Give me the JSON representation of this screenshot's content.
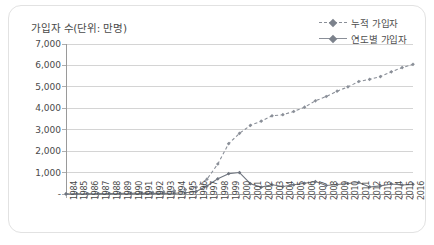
{
  "card": {
    "title": "가입자 수(단위: 만명)"
  },
  "legend": {
    "position": "top-right",
    "items": [
      {
        "label": "누적 가입자",
        "style": "dashed",
        "marker": "diamond",
        "color": "#8a8f98"
      },
      {
        "label": "연도별 가입자",
        "style": "solid",
        "marker": "diamond",
        "color": "#6f757f"
      }
    ]
  },
  "chart_data": {
    "type": "line",
    "title": "가입자 수(단위: 만명)",
    "xlabel": "",
    "ylabel": "가입자 수(단위: 만명)",
    "grid": true,
    "legend_position": "top-right",
    "ylim": [
      0,
      7000
    ],
    "yticks": [
      0,
      1000,
      2000,
      3000,
      4000,
      5000,
      6000,
      7000
    ],
    "ytick_labels": [
      "-",
      "1,000",
      "2,000",
      "3,000",
      "4,000",
      "5,000",
      "6,000",
      "7,000"
    ],
    "categories": [
      "1984",
      "1985",
      "1986",
      "1987",
      "1988",
      "1989",
      "1990",
      "1991",
      "1992",
      "1993",
      "1994",
      "1995",
      "1996",
      "1997",
      "1998",
      "1999",
      "2000",
      "2001",
      "2002",
      "2003",
      "2004",
      "2005",
      "2006",
      "2007",
      "2008",
      "2009",
      "2010",
      "2011",
      "2012",
      "2013",
      "2014",
      "2015",
      "2016"
    ],
    "series": [
      {
        "name": "누적 가입자",
        "style": "dashed",
        "color": "#8a8f98",
        "values": [
          3,
          5,
          8,
          12,
          20,
          30,
          45,
          62,
          82,
          110,
          145,
          200,
          320,
          690,
          1400,
          2350,
          2830,
          3200,
          3400,
          3650,
          3700,
          3850,
          4050,
          4350,
          4550,
          4800,
          5000,
          5250,
          5350,
          5480,
          5700,
          5900,
          6050
        ]
      },
      {
        "name": "연도별 가입자",
        "style": "solid",
        "color": "#6f757f",
        "values": [
          3,
          2,
          3,
          4,
          8,
          10,
          15,
          17,
          20,
          28,
          35,
          55,
          120,
          370,
          710,
          950,
          1000,
          480,
          320,
          430,
          350,
          430,
          500,
          580,
          400,
          440,
          490,
          540,
          330,
          380,
          470,
          420,
          450
        ]
      }
    ]
  }
}
